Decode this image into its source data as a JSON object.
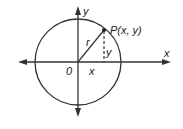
{
  "diagram": {
    "type": "unit-circle-coordinate-diagram",
    "colors": {
      "stroke": "#333333",
      "background": "#ffffff"
    },
    "axes": {
      "x_label": "x",
      "y_label": "y",
      "origin_label": "0"
    },
    "circle": {
      "center": [
        78,
        62
      ],
      "radius": 43
    },
    "point": {
      "label": "P(x, y)",
      "position": [
        104,
        30
      ]
    },
    "segments": {
      "radius_label": "r",
      "horizontal_label": "x",
      "vertical_label": "y"
    }
  }
}
